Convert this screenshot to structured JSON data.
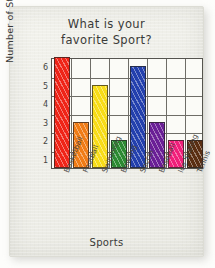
{
  "chart_data": {
    "type": "bar",
    "title": "What is your favorite Sport?",
    "title_line1": "What is your",
    "title_line2": "favorite Sport?",
    "xlabel": "Sports",
    "ylabel": "Number of Students",
    "categories": [
      "Basketball",
      "Football",
      "Swimming",
      "Bowling",
      "Soccer",
      "Baseball",
      "Ice Skating",
      "Tennis"
    ],
    "values": [
      6,
      2.5,
      4.5,
      1.5,
      5.5,
      2.5,
      1.5,
      1.5
    ],
    "colors": [
      "#ef2418",
      "#f07c16",
      "#f7dc18",
      "#2c8a32",
      "#2340ad",
      "#6a1f96",
      "#f01f7a",
      "#5a2e12"
    ],
    "yticks": [
      1,
      2,
      3,
      4,
      5,
      6
    ],
    "ylim": [
      0,
      6
    ],
    "grid": true,
    "legend": false,
    "style": "hand-drawn colored-pencil bar chart on paper"
  }
}
